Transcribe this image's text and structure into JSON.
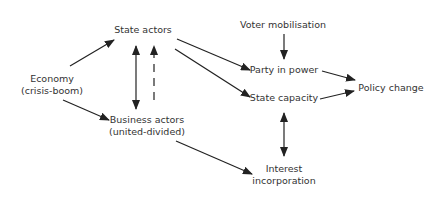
{
  "diagram": {
    "nodes": {
      "economy": {
        "line1": "Economy",
        "line2": "(crisis-boom)"
      },
      "state_actors": {
        "label": "State actors"
      },
      "business_actors": {
        "line1": "Business actors",
        "line2": "(united-divided)"
      },
      "voter_mobilisation": {
        "label": "Voter mobilisation"
      },
      "party_in_power": {
        "label": "Party in power"
      },
      "state_capacity": {
        "label": "State capacity"
      },
      "policy_change": {
        "label": "Policy change"
      },
      "interest_incorporation": {
        "line1": "Interest",
        "line2": "incorporation"
      }
    },
    "edges": [
      {
        "from": "Economy",
        "to": "State actors",
        "style": "solid"
      },
      {
        "from": "Economy",
        "to": "Business actors",
        "style": "solid"
      },
      {
        "from": "State actors",
        "to": "Business actors",
        "style": "solid-bidirectional"
      },
      {
        "from": "Business actors",
        "to": "State actors",
        "style": "dashed"
      },
      {
        "from": "State actors",
        "to": "Party in power",
        "style": "solid"
      },
      {
        "from": "State actors",
        "to": "State capacity",
        "style": "solid"
      },
      {
        "from": "Voter mobilisation",
        "to": "Party in power",
        "style": "solid"
      },
      {
        "from": "Party in power",
        "to": "Policy change",
        "style": "solid"
      },
      {
        "from": "State capacity",
        "to": "Policy change",
        "style": "solid"
      },
      {
        "from": "State capacity",
        "to": "Interest incorporation",
        "style": "solid-bidirectional"
      },
      {
        "from": "Business actors",
        "to": "Interest incorporation",
        "style": "solid"
      }
    ],
    "colors": {
      "line": "#222222",
      "text": "#333333",
      "background": "#ffffff"
    }
  }
}
